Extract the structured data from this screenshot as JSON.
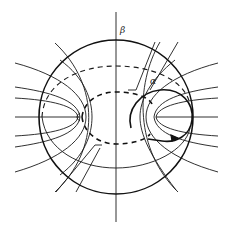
{
  "figure": {
    "labels": {
      "beta": "β",
      "alpha": "α"
    },
    "colors": {
      "ink": "#111111",
      "background": "#ffffff"
    }
  }
}
